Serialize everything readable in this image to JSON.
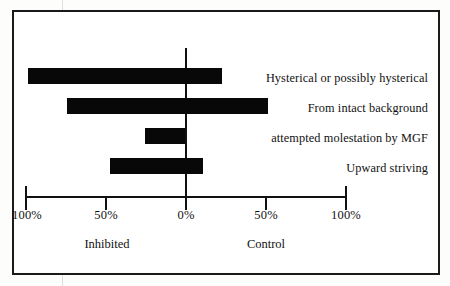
{
  "figure": {
    "frame_color": "#1a1a1a",
    "bar_color": "#080808",
    "axis_color": "#111111"
  },
  "chart_data": {
    "type": "bar",
    "orientation": "horizontal",
    "style": "diverging",
    "title": "",
    "subtitle": "",
    "xlabel": "",
    "ylabel": "",
    "xlim": [
      -100,
      100
    ],
    "grid": false,
    "legend": false,
    "axis_tick_labels": [
      "100%",
      "50%",
      "0%",
      "50%",
      "100%"
    ],
    "axis_tick_values": [
      -100,
      -50,
      0,
      50,
      100
    ],
    "group_labels": [
      {
        "label": "Inhibited",
        "side": "left",
        "center_value": -50
      },
      {
        "label": "Control",
        "side": "right",
        "center_value": 50
      }
    ],
    "categories": [
      "Hysterical or possibly hysterical",
      "From intact background",
      "attempted molestation by MGF",
      "Upward striving"
    ],
    "series": [
      {
        "name": "Inhibited",
        "values": [
          -98,
          -74,
          -25,
          -47
        ]
      },
      {
        "name": "Control",
        "values": [
          23,
          52,
          0,
          11
        ]
      }
    ],
    "bars": [
      {
        "category": "Hysterical or possibly hysterical",
        "inhibited": -98,
        "control": 23,
        "start": -98,
        "end": 23
      },
      {
        "category": "From intact background",
        "inhibited": -74,
        "control": 52,
        "start": -74,
        "end": 52
      },
      {
        "category": "attempted molestation by MGF",
        "inhibited": -25,
        "control": 0,
        "start": -25,
        "end": 0
      },
      {
        "category": "Upward striving",
        "inhibited": -47,
        "control": 11,
        "start": -47,
        "end": 11
      }
    ]
  }
}
